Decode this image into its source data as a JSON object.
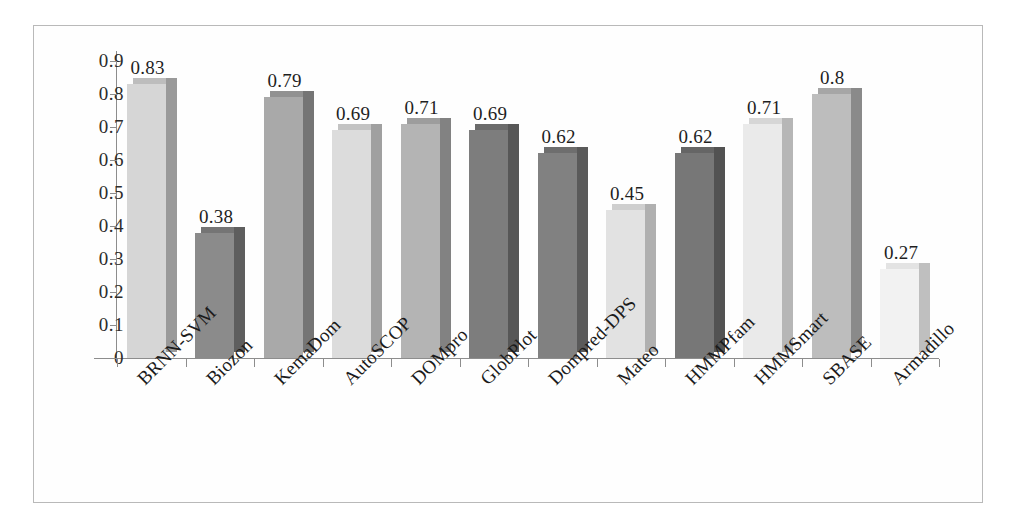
{
  "chart_data": {
    "type": "bar",
    "title": "",
    "subtitle": "",
    "xlabel": "",
    "ylabel": "",
    "ylim": [
      0,
      0.9
    ],
    "grid": false,
    "legend": "none",
    "style": "3d-bar-grayscale",
    "categories": [
      "BRNN-SVM",
      "Biozon",
      "KemaDom",
      "AutoSCOP",
      "DOMpro",
      "GlobPlot",
      "Dompred-DPS",
      "Mateo",
      "HMMPfam",
      "HMMSmart",
      "SBASE",
      "Armadillo"
    ],
    "values": [
      0.83,
      0.38,
      0.79,
      0.69,
      0.71,
      0.69,
      0.62,
      0.45,
      0.62,
      0.71,
      0.8,
      0.27
    ],
    "value_labels": [
      "0.83",
      "0.38",
      "0.79",
      "0.69",
      "0.71",
      "0.69",
      "0.62",
      "0.45",
      "0.62",
      "0.71",
      "0.8",
      "0.27"
    ],
    "bar_colors": [
      "#d6d6d6",
      "#8b8b8b",
      "#a9a9a9",
      "#dcdcdc",
      "#b4b4b4",
      "#7d7d7d",
      "#818181",
      "#e2e2e2",
      "#777777",
      "#eaeaea",
      "#bdbdbd",
      "#f2f2f2"
    ],
    "bar_side_colors": [
      "#9a9a9a",
      "#5e5e5e",
      "#757575",
      "#a0a0a0",
      "#828282",
      "#575757",
      "#5a5a5a",
      "#b0b0b0",
      "#525252",
      "#b6b6b6",
      "#8a8a8a",
      "#bfbfbf"
    ],
    "bar_top_colors": [
      "#bdbdbd",
      "#757575",
      "#919191",
      "#c3c3c3",
      "#9d9d9d",
      "#6b6b6b",
      "#6e6e6e",
      "#cfcfcf",
      "#656565",
      "#d6d6d6",
      "#a6a6a6",
      "#e3e3e3"
    ],
    "ytick_labels": [
      "0.9",
      "0.8",
      "0.7",
      "0.6",
      "0.5",
      "0.4",
      "0.3",
      "0.2",
      "0.1",
      "0"
    ],
    "ytick_values": [
      0.9,
      0.8,
      0.7,
      0.6,
      0.5,
      0.4,
      0.3,
      0.2,
      0.1,
      0
    ]
  },
  "figure": {
    "border_color": "#b9b9b9",
    "axis_color": "#8d8d8d",
    "text_color": "#1f1f1f",
    "background": "#ffffff"
  }
}
